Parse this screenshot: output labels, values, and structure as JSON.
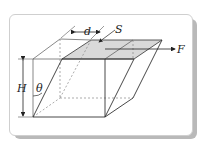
{
  "labels": {
    "d": "d",
    "S": "S",
    "F": "F",
    "H": "H",
    "theta": "θ"
  },
  "colors": {
    "line": "#333333",
    "dashed": "#888888",
    "shaded_face": "#d9d9d9",
    "shadow": "#b9b9b9"
  }
}
